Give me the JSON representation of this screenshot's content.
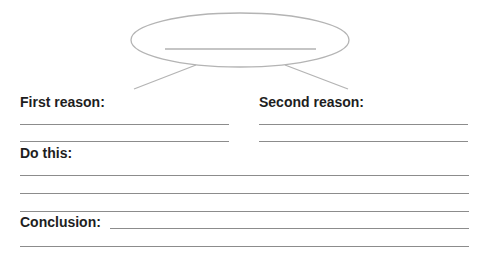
{
  "worksheet": {
    "topic_blank": "",
    "first_reason": {
      "label": "First reason:"
    },
    "second_reason": {
      "label": "Second reason:"
    },
    "do_this": {
      "label": "Do this:"
    },
    "conclusion": {
      "label": "Conclusion:"
    }
  },
  "colors": {
    "ink": "#1e1e1e",
    "rule": "#8c8c8c",
    "shape": "#b4b4b4"
  }
}
